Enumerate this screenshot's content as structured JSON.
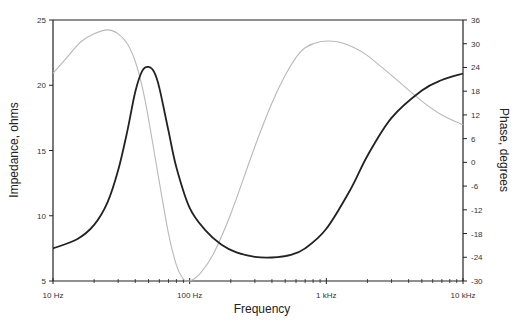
{
  "chart_data": {
    "type": "line",
    "title": "",
    "xlabel": "Frequency",
    "ylabel": "Impedance, ohms",
    "y2label": "Phase, degrees",
    "xscale": "log",
    "xlim": [
      10,
      10000
    ],
    "ylim": [
      5,
      25
    ],
    "y2lim": [
      -30,
      36
    ],
    "x_ticks": [
      {
        "value": 10,
        "label": "10 Hz"
      },
      {
        "value": 100,
        "label": "100 Hz"
      },
      {
        "value": 1000,
        "label": "1 kHz"
      },
      {
        "value": 10000,
        "label": "10 kHz"
      }
    ],
    "y_ticks": [
      5,
      10,
      15,
      20,
      25
    ],
    "y2_ticks": [
      -30,
      -24,
      -18,
      -12,
      -6,
      0,
      6,
      12,
      18,
      24,
      30,
      36
    ],
    "grid": false,
    "legend": null,
    "series": [
      {
        "name": "Impedance",
        "axis": "left",
        "color": "#222222",
        "style": "solid",
        "x": [
          10,
          15,
          20,
          25,
          30,
          35,
          40,
          45,
          50,
          55,
          60,
          70,
          80,
          100,
          130,
          170,
          220,
          300,
          400,
          550,
          700,
          1000,
          1500,
          2000,
          3000,
          5000,
          7000,
          10000
        ],
        "values": [
          7.5,
          8.2,
          9.3,
          11.0,
          13.5,
          16.5,
          19.5,
          21.1,
          21.4,
          21.0,
          19.8,
          16.5,
          13.7,
          10.6,
          8.9,
          7.8,
          7.2,
          6.85,
          6.8,
          7.0,
          7.5,
          9.0,
          12.0,
          14.6,
          17.5,
          19.6,
          20.4,
          20.9
        ]
      },
      {
        "name": "Phase",
        "axis": "right",
        "color": "#b8b8b8",
        "style": "solid",
        "x": [
          10,
          13,
          16,
          20,
          25,
          30,
          35,
          40,
          45,
          50,
          60,
          70,
          80,
          90,
          100,
          120,
          150,
          200,
          300,
          400,
          500,
          600,
          700,
          900,
          1200,
          1600,
          2000,
          3000,
          5000,
          7000,
          10000
        ],
        "values": [
          22.5,
          27.0,
          30.5,
          32.5,
          33.5,
          32.5,
          30.0,
          25.5,
          19.0,
          11.0,
          -5.0,
          -18.0,
          -26.0,
          -29.5,
          -30.0,
          -28.0,
          -23.0,
          -13.0,
          4.0,
          15.0,
          22.0,
          26.5,
          29.0,
          30.5,
          30.5,
          29.0,
          27.0,
          22.0,
          15.5,
          12.0,
          9.5
        ]
      }
    ]
  },
  "labels": {
    "xlabel": "Frequency",
    "ylabel": "Impedance, ohms",
    "y2label": "Phase, degrees"
  }
}
